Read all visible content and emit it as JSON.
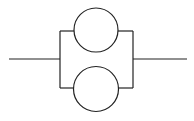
{
  "diagram": {
    "type": "parallel-circuit",
    "stroke_color": "#222222",
    "background": "#ffffff",
    "elements": [
      {
        "name": "input-lead",
        "kind": "line"
      },
      {
        "name": "top-element",
        "kind": "circle"
      },
      {
        "name": "bottom-element",
        "kind": "circle"
      },
      {
        "name": "output-lead",
        "kind": "line"
      }
    ]
  }
}
